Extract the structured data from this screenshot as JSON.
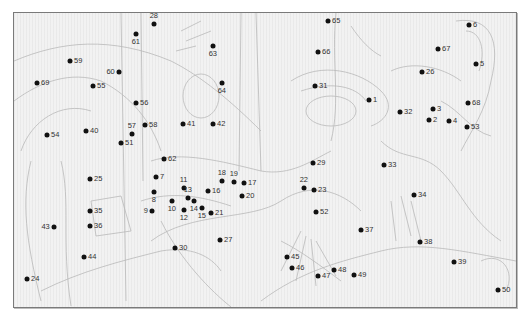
{
  "puzzle": {
    "type": "connect-the-dots",
    "dot_color": "#111111",
    "line_color": "#b9b9b9",
    "background": "#f2f2f2",
    "dots": [
      {
        "n": "1",
        "x": 369,
        "y": 100,
        "pos": "r"
      },
      {
        "n": "2",
        "x": 429,
        "y": 120,
        "pos": "r"
      },
      {
        "n": "3",
        "x": 433,
        "y": 109,
        "pos": "r"
      },
      {
        "n": "4",
        "x": 449,
        "y": 121,
        "pos": "r"
      },
      {
        "n": "5",
        "x": 476,
        "y": 64,
        "pos": "r"
      },
      {
        "n": "6",
        "x": 469,
        "y": 25,
        "pos": "r"
      },
      {
        "n": "7",
        "x": 156,
        "y": 177,
        "pos": "r"
      },
      {
        "n": "8",
        "x": 154,
        "y": 192,
        "pos": "b"
      },
      {
        "n": "9",
        "x": 152,
        "y": 211,
        "pos": "l"
      },
      {
        "n": "10",
        "x": 172,
        "y": 201,
        "pos": "b"
      },
      {
        "n": "11",
        "x": 184,
        "y": 188,
        "pos": "t"
      },
      {
        "n": "12",
        "x": 184,
        "y": 210,
        "pos": "b"
      },
      {
        "n": "13",
        "x": 188,
        "y": 198,
        "pos": "t"
      },
      {
        "n": "14",
        "x": 194,
        "y": 201,
        "pos": "b"
      },
      {
        "n": "15",
        "x": 202,
        "y": 208,
        "pos": "b"
      },
      {
        "n": "16",
        "x": 208,
        "y": 191,
        "pos": "r"
      },
      {
        "n": "17",
        "x": 244,
        "y": 183,
        "pos": "r"
      },
      {
        "n": "18",
        "x": 222,
        "y": 181,
        "pos": "t"
      },
      {
        "n": "19",
        "x": 234,
        "y": 182,
        "pos": "t"
      },
      {
        "n": "20",
        "x": 242,
        "y": 196,
        "pos": "r"
      },
      {
        "n": "21",
        "x": 211,
        "y": 213,
        "pos": "r"
      },
      {
        "n": "22",
        "x": 304,
        "y": 188,
        "pos": "t"
      },
      {
        "n": "23",
        "x": 314,
        "y": 190,
        "pos": "r"
      },
      {
        "n": "24",
        "x": 27,
        "y": 279,
        "pos": "r"
      },
      {
        "n": "25",
        "x": 90,
        "y": 179,
        "pos": "r"
      },
      {
        "n": "26",
        "x": 422,
        "y": 72,
        "pos": "r"
      },
      {
        "n": "27",
        "x": 220,
        "y": 240,
        "pos": "r"
      },
      {
        "n": "28",
        "x": 154,
        "y": 24,
        "pos": "t"
      },
      {
        "n": "29",
        "x": 313,
        "y": 163,
        "pos": "r"
      },
      {
        "n": "30",
        "x": 175,
        "y": 248,
        "pos": "r"
      },
      {
        "n": "31",
        "x": 315,
        "y": 86,
        "pos": "r"
      },
      {
        "n": "32",
        "x": 400,
        "y": 112,
        "pos": "r"
      },
      {
        "n": "33",
        "x": 384,
        "y": 165,
        "pos": "r"
      },
      {
        "n": "34",
        "x": 414,
        "y": 195,
        "pos": "r"
      },
      {
        "n": "35",
        "x": 90,
        "y": 211,
        "pos": "r"
      },
      {
        "n": "36",
        "x": 90,
        "y": 226,
        "pos": "r"
      },
      {
        "n": "37",
        "x": 361,
        "y": 230,
        "pos": "r"
      },
      {
        "n": "38",
        "x": 420,
        "y": 242,
        "pos": "r"
      },
      {
        "n": "39",
        "x": 454,
        "y": 262,
        "pos": "r"
      },
      {
        "n": "40",
        "x": 86,
        "y": 131,
        "pos": "r"
      },
      {
        "n": "41",
        "x": 183,
        "y": 124,
        "pos": "r"
      },
      {
        "n": "42",
        "x": 213,
        "y": 124,
        "pos": "r"
      },
      {
        "n": "43",
        "x": 54,
        "y": 227,
        "pos": "l"
      },
      {
        "n": "44",
        "x": 84,
        "y": 257,
        "pos": "r"
      },
      {
        "n": "45",
        "x": 287,
        "y": 257,
        "pos": "r"
      },
      {
        "n": "46",
        "x": 292,
        "y": 268,
        "pos": "r"
      },
      {
        "n": "47",
        "x": 318,
        "y": 276,
        "pos": "r"
      },
      {
        "n": "48",
        "x": 334,
        "y": 270,
        "pos": "r"
      },
      {
        "n": "49",
        "x": 354,
        "y": 275,
        "pos": "r"
      },
      {
        "n": "50",
        "x": 498,
        "y": 290,
        "pos": "r"
      },
      {
        "n": "51",
        "x": 121,
        "y": 143,
        "pos": "r"
      },
      {
        "n": "52",
        "x": 316,
        "y": 212,
        "pos": "r"
      },
      {
        "n": "53",
        "x": 467,
        "y": 127,
        "pos": "r"
      },
      {
        "n": "54",
        "x": 47,
        "y": 135,
        "pos": "r"
      },
      {
        "n": "55",
        "x": 93,
        "y": 86,
        "pos": "r"
      },
      {
        "n": "56",
        "x": 136,
        "y": 103,
        "pos": "r"
      },
      {
        "n": "57",
        "x": 132,
        "y": 134,
        "pos": "t"
      },
      {
        "n": "58",
        "x": 145,
        "y": 125,
        "pos": "r"
      },
      {
        "n": "59",
        "x": 70,
        "y": 61,
        "pos": "r"
      },
      {
        "n": "60",
        "x": 119,
        "y": 72,
        "pos": "l"
      },
      {
        "n": "61",
        "x": 136,
        "y": 34,
        "pos": "b"
      },
      {
        "n": "62",
        "x": 164,
        "y": 159,
        "pos": "r"
      },
      {
        "n": "63",
        "x": 213,
        "y": 46,
        "pos": "b"
      },
      {
        "n": "64",
        "x": 222,
        "y": 83,
        "pos": "b"
      },
      {
        "n": "65",
        "x": 328,
        "y": 21,
        "pos": "r"
      },
      {
        "n": "66",
        "x": 318,
        "y": 52,
        "pos": "r"
      },
      {
        "n": "67",
        "x": 438,
        "y": 49,
        "pos": "r"
      },
      {
        "n": "68",
        "x": 468,
        "y": 103,
        "pos": "r"
      },
      {
        "n": "69",
        "x": 37,
        "y": 83,
        "pos": "r"
      }
    ]
  }
}
